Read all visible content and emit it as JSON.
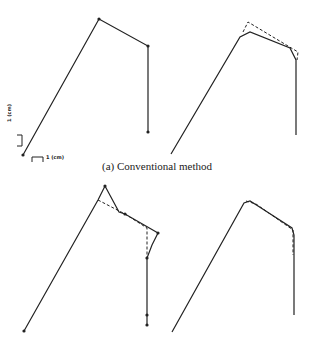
{
  "figure": {
    "caption_a": "(a) Conventional method",
    "scale_vertical_label": "1 (cm)",
    "scale_horizontal_label": "1 (cm)"
  },
  "panels": [
    {
      "id": "a-left",
      "style": "solid",
      "points": [
        [
          23,
          155
        ],
        [
          99,
          19
        ],
        [
          148,
          46
        ],
        [
          148,
          132
        ]
      ]
    },
    {
      "id": "a-right-dashed",
      "style": "dashed",
      "points": [
        [
          243,
          32
        ],
        [
          248,
          22
        ],
        [
          298,
          52
        ],
        [
          297,
          60
        ]
      ]
    },
    {
      "id": "a-right-solid",
      "style": "solid",
      "points": [
        [
          171,
          154
        ],
        [
          240,
          37
        ],
        [
          250,
          32
        ],
        [
          290,
          48
        ],
        [
          296,
          60
        ],
        [
          296,
          135
        ]
      ]
    },
    {
      "id": "b-left-solid",
      "style": "solid",
      "points": [
        [
          24,
          331
        ],
        [
          98,
          200
        ],
        [
          105,
          186
        ],
        [
          119,
          212
        ],
        [
          125,
          214
        ],
        [
          158,
          233
        ],
        [
          152,
          245
        ],
        [
          147,
          258
        ],
        [
          147,
          325
        ]
      ]
    },
    {
      "id": "b-left-dashed",
      "style": "dashed",
      "points": [
        [
          98,
          200
        ],
        [
          125,
          214
        ],
        [
          147,
          228
        ],
        [
          147,
          258
        ]
      ]
    },
    {
      "id": "b-right-solid",
      "style": "solid",
      "points": [
        [
          172,
          332
        ],
        [
          244,
          203
        ],
        [
          250,
          201
        ],
        [
          258,
          206
        ],
        [
          292,
          228
        ],
        [
          294,
          235
        ],
        [
          294,
          315
        ]
      ]
    },
    {
      "id": "b-right-dashed",
      "style": "dashed",
      "points": [
        [
          246,
          201
        ],
        [
          256,
          204
        ],
        [
          293,
          230
        ],
        [
          293,
          255
        ]
      ]
    }
  ]
}
